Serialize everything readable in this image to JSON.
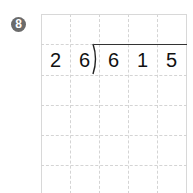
{
  "problem": {
    "number": "8",
    "divisor": [
      "2",
      "6"
    ],
    "dividend": [
      "6",
      "1",
      "5"
    ]
  },
  "grid": {
    "columns": 5,
    "rows": 6
  },
  "colors": {
    "badge": "#6b6b6b",
    "grid_line": "#d4d4d4",
    "text": "#111111"
  }
}
